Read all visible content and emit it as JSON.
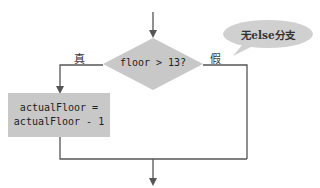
{
  "diagram": {
    "type": "flowchart",
    "decision": {
      "text": "floor > 13?"
    },
    "true_label": "真",
    "false_label": "假",
    "action": {
      "line1": "actualFloor =",
      "line2": "actualFloor - 1"
    },
    "callout": "无else分支",
    "colors": {
      "shape_fill": "#c8c8c8",
      "line": "#555555",
      "callout_fill": "#d0d0d0"
    }
  }
}
